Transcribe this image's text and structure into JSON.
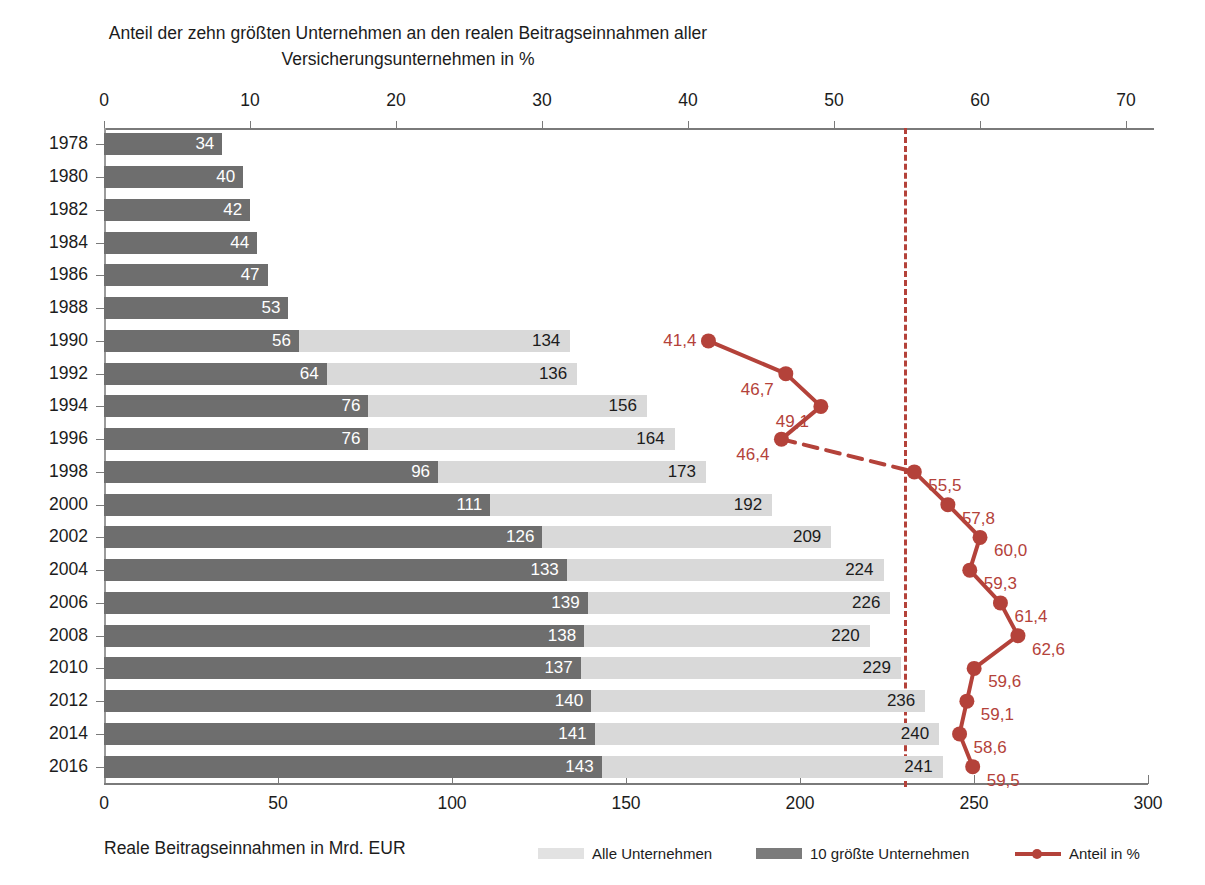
{
  "title": "Anteil der zehn größten Unternehmen an den realen Beitragseinnahmen aller\nVersicherungsunternehmen in %",
  "axes": {
    "top": {
      "label": "Anteil der zehn größten Unternehmen an den realen Beitragseinnahmen aller Versicherungsunternehmen in %",
      "ticks": [
        0,
        10,
        20,
        30,
        40,
        50,
        60,
        70
      ],
      "min": 0,
      "max": 70
    },
    "bottom": {
      "label": "Reale Beitragseinnahmen in Mrd. EUR",
      "ticks": [
        0,
        50,
        100,
        150,
        200,
        250,
        300
      ],
      "min": 0,
      "max": 300
    }
  },
  "legend": {
    "items": [
      {
        "key": "alle",
        "label": "Alle Unternehmen",
        "color": "#e2e2e2",
        "type": "swatch"
      },
      {
        "key": "top10",
        "label": "10 größte Unternehmen",
        "color": "#7b7b7b",
        "type": "swatch"
      },
      {
        "key": "anteil",
        "label": "Anteil in %",
        "color": "#b4423a",
        "type": "line"
      }
    ]
  },
  "reference_line": {
    "value_bottom_axis": 230,
    "color": "#b4423a",
    "style": "dashed"
  },
  "chart_data": {
    "type": "bar",
    "title": "Anteil der zehn größten Unternehmen an den realen Beitragseinnahmen aller Versicherungsunternehmen in %",
    "xlabel": "Reale Beitragseinnahmen in Mrd. EUR",
    "ylabel": "",
    "orientation": "horizontal",
    "grid": false,
    "legend_position": "bottom",
    "xlim": [
      0,
      300
    ],
    "xlim_top": [
      0,
      70
    ],
    "categories": [
      "1978",
      "1980",
      "1982",
      "1984",
      "1986",
      "1988",
      "1990",
      "1992",
      "1994",
      "1996",
      "1998",
      "2000",
      "2002",
      "2004",
      "2006",
      "2008",
      "2010",
      "2012",
      "2014",
      "2016"
    ],
    "series": [
      {
        "name": "Alle Unternehmen",
        "axis": "bottom",
        "unit": "Mrd. EUR",
        "color": "#d9d9d9",
        "values": [
          null,
          null,
          null,
          null,
          null,
          null,
          134,
          136,
          156,
          164,
          173,
          192,
          209,
          224,
          226,
          220,
          229,
          236,
          240,
          241
        ]
      },
      {
        "name": "10 größte Unternehmen",
        "axis": "bottom",
        "unit": "Mrd. EUR",
        "color": "#6e6e6e",
        "values": [
          34,
          40,
          42,
          44,
          47,
          53,
          56,
          64,
          76,
          76,
          96,
          111,
          126,
          133,
          139,
          138,
          137,
          140,
          141,
          143
        ]
      },
      {
        "name": "Anteil in %",
        "axis": "top",
        "unit": "%",
        "color": "#b4423a",
        "type": "line",
        "values": [
          null,
          null,
          null,
          null,
          null,
          null,
          41.4,
          46.7,
          49.1,
          46.4,
          55.5,
          57.8,
          60.0,
          59.3,
          61.4,
          62.6,
          59.6,
          59.1,
          58.6,
          59.5
        ],
        "labels": [
          null,
          null,
          null,
          null,
          null,
          null,
          "41,4",
          "46,7",
          "49,1",
          "46,4",
          "55,5",
          "57,8",
          "60,0",
          "59,3",
          "61,4",
          "62,6",
          "59,6",
          "59,1",
          "58,6",
          "59,5"
        ],
        "dashed_segment_between": [
          "1996",
          "1998"
        ]
      }
    ]
  }
}
